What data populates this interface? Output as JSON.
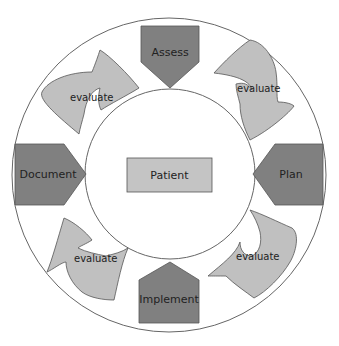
{
  "diagram": {
    "center": {
      "label": "Patient"
    },
    "steps": [
      {
        "id": "assess",
        "label": "Assess"
      },
      {
        "id": "plan",
        "label": "Plan"
      },
      {
        "id": "implement",
        "label": "Implement"
      },
      {
        "id": "document",
        "label": "Document"
      }
    ],
    "transitions": [
      {
        "from": "document",
        "to": "assess",
        "label": "evaluate"
      },
      {
        "from": "assess",
        "to": "plan",
        "label": "evaluate"
      },
      {
        "from": "plan",
        "to": "implement",
        "label": "evaluate"
      },
      {
        "from": "implement",
        "to": "document",
        "label": "evaluate"
      }
    ]
  },
  "colors": {
    "step_fill": "#808080",
    "arrow_fill": "#c0c0c0",
    "center_fill": "#c4c4c4",
    "stroke": "#555555",
    "circle_stroke": "#666666",
    "background": "#ffffff"
  }
}
